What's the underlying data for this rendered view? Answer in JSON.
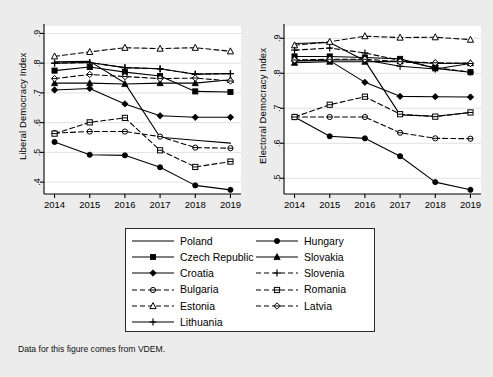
{
  "figure": {
    "background_color": "#ececed",
    "panel_color": "#ffffff",
    "line_color": "#000000",
    "caption": "Data for this figure comes from VDEM."
  },
  "legend": {
    "columns": [
      [
        {
          "label": "Poland",
          "key": "poland"
        },
        {
          "label": "Czech Republic",
          "key": "czech_republic"
        },
        {
          "label": "Croatia",
          "key": "croatia"
        },
        {
          "label": "Bulgaria",
          "key": "bulgaria"
        },
        {
          "label": "Estonia",
          "key": "estonia"
        },
        {
          "label": "Lithuania",
          "key": "lithuania"
        }
      ],
      [
        {
          "label": "Hungary",
          "key": "hungary"
        },
        {
          "label": "Slovakia",
          "key": "slovakia"
        },
        {
          "label": "Slovenia",
          "key": "slovenia"
        },
        {
          "label": "Romania",
          "key": "romania"
        },
        {
          "label": "Latvia",
          "key": "latvia"
        }
      ]
    ]
  },
  "chart_data": [
    {
      "type": "line",
      "title": "",
      "xlabel": "",
      "ylabel": "Liberal Democracy Index",
      "x": [
        2014,
        2015,
        2016,
        2017,
        2018,
        2019
      ],
      "xlim": [
        2013.7,
        2019.3
      ],
      "ylim": [
        0.36,
        0.925
      ],
      "yticks": [
        0.4,
        0.5,
        0.6,
        0.7,
        0.8,
        0.9
      ],
      "ytick_labels": [
        ".4",
        ".5",
        ".6",
        ".7",
        ".8",
        ".9"
      ],
      "xtick_labels": [
        "2014",
        "2015",
        "2016",
        "2017",
        "2018",
        "2019"
      ],
      "grid": true,
      "legend_position": "below",
      "series": [
        {
          "name": "Poland",
          "key": "poland",
          "style": "solid",
          "marker": "none",
          "values": [
            0.805,
            0.806,
            0.733,
            0.551,
            0.541,
            0.531
          ]
        },
        {
          "name": "Czech Republic",
          "key": "czech_republic",
          "style": "solid",
          "marker": "filled-square",
          "values": [
            0.775,
            0.787,
            0.77,
            0.757,
            0.705,
            0.703
          ]
        },
        {
          "name": "Croatia",
          "key": "croatia",
          "style": "solid",
          "marker": "filled-diamond",
          "values": [
            0.71,
            0.715,
            0.663,
            0.623,
            0.618,
            0.618
          ]
        },
        {
          "name": "Bulgaria",
          "key": "bulgaria",
          "style": "dashed",
          "marker": "open-circle",
          "values": [
            0.565,
            0.57,
            0.57,
            0.553,
            0.516,
            0.514
          ]
        },
        {
          "name": "Estonia",
          "key": "estonia",
          "style": "dashed",
          "marker": "open-triangle",
          "values": [
            0.823,
            0.838,
            0.852,
            0.849,
            0.852,
            0.84
          ]
        },
        {
          "name": "Lithuania",
          "key": "lithuania",
          "style": "solid",
          "marker": "plus",
          "values": [
            0.8,
            0.802,
            0.785,
            0.781,
            0.763,
            0.765
          ]
        },
        {
          "name": "Hungary",
          "key": "hungary",
          "style": "solid",
          "marker": "filled-circle",
          "values": [
            0.535,
            0.492,
            0.49,
            0.45,
            0.389,
            0.374
          ]
        },
        {
          "name": "Slovakia",
          "key": "slovakia",
          "style": "solid",
          "marker": "filled-triangle",
          "values": [
            0.733,
            0.733,
            0.73,
            0.733,
            0.733,
            0.744
          ]
        },
        {
          "name": "Slovenia",
          "key": "slovenia",
          "style": "dashed",
          "marker": "plus",
          "values": [
            0.8,
            0.802,
            0.785,
            0.781,
            0.763,
            0.765
          ]
        },
        {
          "name": "Romania",
          "key": "romania",
          "style": "dashed",
          "marker": "open-square",
          "values": [
            0.563,
            0.601,
            0.616,
            0.507,
            0.451,
            0.469
          ]
        },
        {
          "name": "Latvia",
          "key": "latvia",
          "style": "dashed",
          "marker": "open-diamond",
          "values": [
            0.748,
            0.762,
            0.755,
            0.748,
            0.75,
            0.74
          ]
        }
      ]
    },
    {
      "type": "line",
      "title": "",
      "xlabel": "",
      "ylabel": "Electoral Democracy Index",
      "x": [
        2014,
        2015,
        2016,
        2017,
        2018,
        2019
      ],
      "xlim": [
        2013.7,
        2019.3
      ],
      "ylim": [
        0.455,
        0.935
      ],
      "yticks": [
        0.5,
        0.6,
        0.7,
        0.8,
        0.9
      ],
      "ytick_labels": [
        ".5",
        ".6",
        ".7",
        ".8",
        ".9"
      ],
      "xtick_labels": [
        "2014",
        "2015",
        "2016",
        "2017",
        "2018",
        "2019"
      ],
      "grid": true,
      "legend_position": "below",
      "series": [
        {
          "name": "Poland",
          "key": "poland",
          "style": "solid",
          "marker": "none",
          "values": [
            0.885,
            0.888,
            0.836,
            0.681,
            0.677,
            0.688
          ]
        },
        {
          "name": "Czech Republic",
          "key": "czech_republic",
          "style": "solid",
          "marker": "filled-square",
          "values": [
            0.848,
            0.848,
            0.845,
            0.841,
            0.814,
            0.803
          ]
        },
        {
          "name": "Croatia",
          "key": "croatia",
          "style": "solid",
          "marker": "filled-diamond",
          "values": [
            0.835,
            0.836,
            0.774,
            0.734,
            0.733,
            0.732
          ]
        },
        {
          "name": "Bulgaria",
          "key": "bulgaria",
          "style": "dashed",
          "marker": "open-circle",
          "values": [
            0.675,
            0.675,
            0.675,
            0.63,
            0.614,
            0.613
          ]
        },
        {
          "name": "Estonia",
          "key": "estonia",
          "style": "dashed",
          "marker": "open-triangle",
          "values": [
            0.88,
            0.89,
            0.906,
            0.902,
            0.903,
            0.896
          ]
        },
        {
          "name": "Lithuania",
          "key": "lithuania",
          "style": "solid",
          "marker": "plus",
          "values": [
            0.836,
            0.838,
            0.838,
            0.82,
            0.812,
            0.828
          ]
        },
        {
          "name": "Hungary",
          "key": "hungary",
          "style": "solid",
          "marker": "filled-circle",
          "values": [
            0.675,
            0.62,
            0.614,
            0.563,
            0.489,
            0.467
          ]
        },
        {
          "name": "Slovakia",
          "key": "slovakia",
          "style": "solid",
          "marker": "filled-triangle",
          "values": [
            0.83,
            0.833,
            0.833,
            0.834,
            0.828,
            0.829
          ]
        },
        {
          "name": "Slovenia",
          "key": "slovenia",
          "style": "dashed",
          "marker": "plus",
          "values": [
            0.866,
            0.872,
            0.858,
            0.837,
            0.816,
            0.803
          ]
        },
        {
          "name": "Romania",
          "key": "romania",
          "style": "dashed",
          "marker": "open-square",
          "values": [
            0.675,
            0.71,
            0.733,
            0.683,
            0.676,
            0.688
          ]
        },
        {
          "name": "Latvia",
          "key": "latvia",
          "style": "dashed",
          "marker": "open-diamond",
          "values": [
            0.838,
            0.84,
            0.84,
            0.833,
            0.83,
            0.828
          ]
        }
      ]
    }
  ]
}
